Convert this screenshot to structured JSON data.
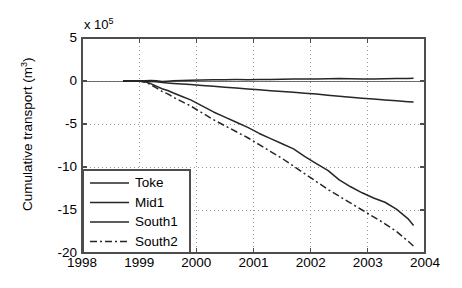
{
  "chart_data": {
    "type": "line",
    "title": "",
    "xlabel": "",
    "ylabel": "Cumulative transport (m",
    "ylabel_sup": "3",
    "ylabel_suffix": ")",
    "y_multiplier_prefix": "x 10",
    "y_multiplier_exp": "5",
    "xlim": [
      1998,
      2004
    ],
    "ylim": [
      -20,
      5
    ],
    "grid": true,
    "legend_position": "lower-left",
    "xticks": [
      "1998",
      "1999",
      "2000",
      "2001",
      "2002",
      "2003",
      "2004"
    ],
    "xtick_values": [
      1998,
      1999,
      2000,
      2001,
      2002,
      2003,
      2004
    ],
    "yticks": [
      "5",
      "0",
      "-5",
      "-10",
      "-15",
      "-20"
    ],
    "ytick_values": [
      5,
      0,
      -5,
      -10,
      -15,
      -20
    ],
    "x": [
      1999.0,
      1999.1,
      1999.2,
      1999.3,
      1999.4,
      1999.5,
      1999.6,
      1999.75,
      1999.9,
      2000.1,
      2000.3,
      2000.5,
      2000.7,
      2000.9,
      2001.1,
      2001.3,
      2001.5,
      2001.7,
      2001.9,
      2002.1,
      2002.3,
      2002.5,
      2002.7,
      2002.9,
      2003.1,
      2003.3,
      2003.5,
      2003.7,
      2003.8
    ],
    "series": [
      {
        "name": "Toke",
        "style": "solid",
        "color": "#262626",
        "values": [
          0.0,
          0.02,
          0.05,
          0.02,
          -0.05,
          -0.02,
          0.02,
          0.05,
          0.1,
          0.12,
          0.14,
          0.15,
          0.16,
          0.15,
          0.16,
          0.18,
          0.2,
          0.22,
          0.22,
          0.23,
          0.25,
          0.28,
          0.25,
          0.22,
          0.24,
          0.26,
          0.28,
          0.3,
          0.32
        ]
      },
      {
        "name": "Mid1",
        "style": "solid",
        "color": "#262626",
        "values": [
          0.0,
          -0.02,
          -0.05,
          -0.1,
          -0.18,
          -0.22,
          -0.28,
          -0.35,
          -0.42,
          -0.52,
          -0.62,
          -0.72,
          -0.82,
          -0.92,
          -1.02,
          -1.12,
          -1.22,
          -1.32,
          -1.42,
          -1.52,
          -1.65,
          -1.78,
          -1.9,
          -2.0,
          -2.1,
          -2.2,
          -2.3,
          -2.4,
          -2.45
        ]
      },
      {
        "name": "South1",
        "style": "solid",
        "color": "#262626",
        "values": [
          0.0,
          -0.1,
          -0.3,
          -0.6,
          -0.9,
          -1.1,
          -1.4,
          -1.8,
          -2.2,
          -2.9,
          -3.6,
          -4.2,
          -4.8,
          -5.4,
          -6.1,
          -6.7,
          -7.3,
          -7.9,
          -8.8,
          -9.6,
          -10.4,
          -11.5,
          -12.3,
          -13.0,
          -13.6,
          -14.1,
          -14.9,
          -16.0,
          -16.8
        ]
      },
      {
        "name": "South2",
        "style": "dashdot",
        "color": "#262626",
        "values": [
          0.0,
          -0.15,
          -0.4,
          -0.8,
          -1.2,
          -1.5,
          -1.9,
          -2.4,
          -2.9,
          -3.7,
          -4.5,
          -5.2,
          -5.9,
          -6.6,
          -7.4,
          -8.2,
          -9.0,
          -9.9,
          -10.8,
          -11.7,
          -12.6,
          -13.4,
          -14.2,
          -15.0,
          -15.8,
          -16.6,
          -17.5,
          -18.6,
          -19.2
        ]
      }
    ],
    "legend": [
      "Toke",
      "Mid1",
      "South1",
      "South2"
    ],
    "axis_color": "#4d4d4d",
    "grid_color": "#8c8c8c",
    "background": "#ffffff"
  }
}
